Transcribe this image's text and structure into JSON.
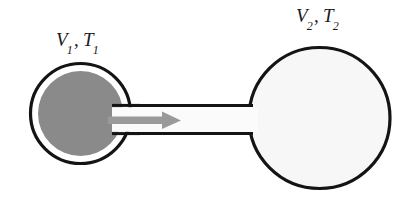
{
  "figure": {
    "type": "apparatus-diagram",
    "background_color": "#ffffff"
  },
  "labels": {
    "left": {
      "symbol_volume": "V",
      "volume_subscript": "1",
      "separator": ",",
      "symbol_temperature": "T",
      "temperature_subscript": "1",
      "full_text": "V1, T1"
    },
    "right": {
      "symbol_volume": "V",
      "volume_subscript": "2",
      "separator": ",",
      "symbol_temperature": "T",
      "temperature_subscript": "2",
      "full_text": "V2, T2"
    }
  },
  "shapes": {
    "left_bulb": {
      "name": "gas-filled-bulb",
      "cx": 80.5,
      "cy": 113.5,
      "r_outer": 51,
      "r_inner": 43,
      "fill": "#8a8a8a",
      "gap_fill": "#ffffff",
      "stroke": "#141414",
      "stroke_width": 3.2
    },
    "right_bulb": {
      "name": "empty-bulb",
      "cx": 319.5,
      "cy": 118,
      "r": 71,
      "fill": "#f7f7f7",
      "stroke": "#141414",
      "stroke_width": 3.2
    },
    "tube": {
      "name": "connecting-tube",
      "x_start": 118,
      "x_end": 252,
      "y_top": 105,
      "y_bottom": 133,
      "fill": "#fafafa",
      "stroke": "#141414",
      "stroke_width": 3.0
    },
    "arrow": {
      "name": "gas-flow-arrow",
      "direction": "right",
      "x_tail": 112,
      "x_tip": 180,
      "y": 120,
      "shaft_thickness": 7,
      "head_width": 16,
      "head_height": 17,
      "color": "#9a9a9a"
    }
  },
  "colors": {
    "gas_gray": "#8a8a8a",
    "arrow_gray": "#9a9a9a",
    "outline_black": "#141414",
    "empty_white": "#f7f7f7",
    "page_white": "#ffffff",
    "text_black": "#1a1a1a"
  }
}
